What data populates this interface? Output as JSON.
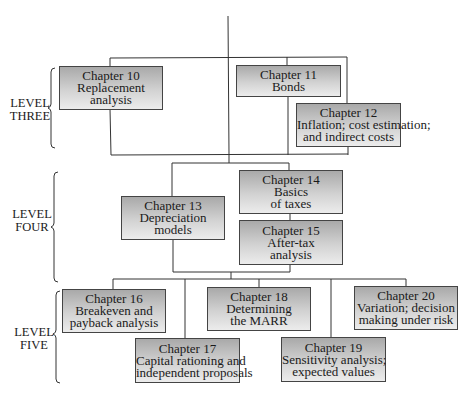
{
  "levels": [
    {
      "line1": "LEVEL",
      "line2": "THREE"
    },
    {
      "line1": "LEVEL",
      "line2": "FOUR"
    },
    {
      "line1": "LEVEL",
      "line2": "FIVE"
    }
  ],
  "chapters": {
    "ch10": {
      "title": "Chapter 10",
      "line1": "Replacement",
      "line2": "analysis"
    },
    "ch11": {
      "title": "Chapter 11",
      "line1": "Bonds"
    },
    "ch12": {
      "title": "Chapter 12",
      "line1": "Inflation; cost estimation;",
      "line2": "and indirect costs"
    },
    "ch13": {
      "title": "Chapter 13",
      "line1": "Depreciation",
      "line2": "models"
    },
    "ch14": {
      "title": "Chapter 14",
      "line1": "Basics",
      "line2": "of taxes"
    },
    "ch15": {
      "title": "Chapter 15",
      "line1": "After-tax",
      "line2": "analysis"
    },
    "ch16": {
      "title": "Chapter 16",
      "line1": "Breakeven and",
      "line2": "payback analysis"
    },
    "ch17": {
      "title": "Chapter 17",
      "line1": "Capital rationing and",
      "line2": "independent proposals"
    },
    "ch18": {
      "title": "Chapter 18",
      "line1": "Determining",
      "line2": "the MARR"
    },
    "ch19": {
      "title": "Chapter 19",
      "line1": "Sensitivity analysis;",
      "line2": "expected values"
    },
    "ch20": {
      "title": "Chapter 20",
      "line1": "Variation; decision",
      "line2": "making under risk"
    }
  }
}
